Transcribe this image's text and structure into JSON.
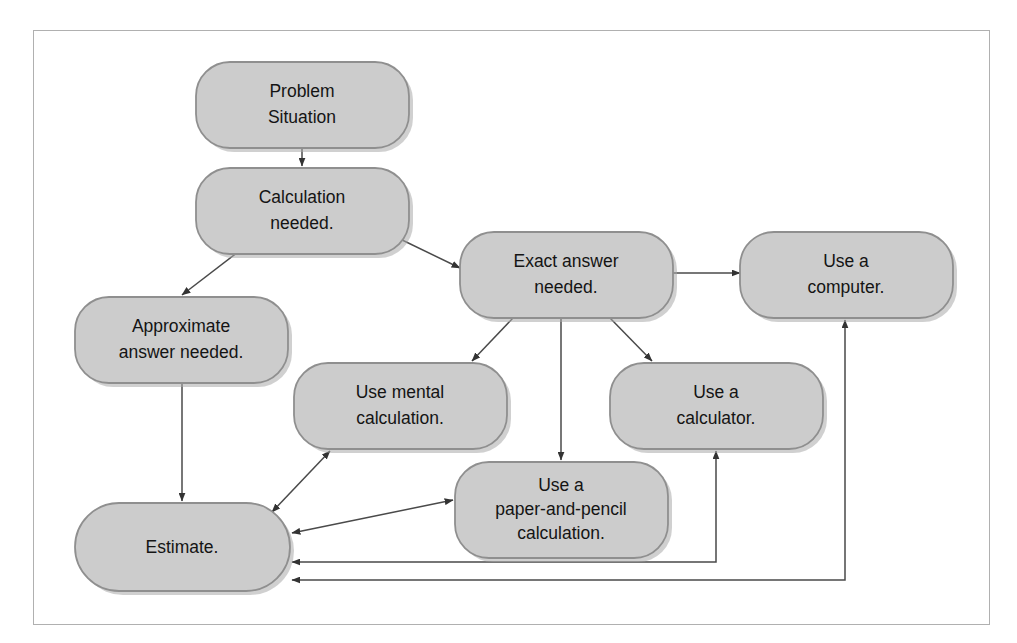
{
  "diagram": {
    "frame": {
      "border_color": "#b0b0b0"
    },
    "style": {
      "node_fill": "#cccccc",
      "node_stroke": "#8f8f8f",
      "edge_color": "#4a4a4a",
      "text_color": "#141414",
      "background": "#ffffff"
    },
    "nodes": [
      {
        "id": "problem-situation",
        "lines": [
          "Problem",
          "Situation"
        ],
        "x": 196,
        "y": 62,
        "w": 213,
        "h": 86
      },
      {
        "id": "calculation-needed",
        "lines": [
          "Calculation",
          "needed."
        ],
        "x": 196,
        "y": 168,
        "w": 213,
        "h": 86
      },
      {
        "id": "exact-answer-needed",
        "lines": [
          "Exact answer",
          "needed."
        ],
        "x": 460,
        "y": 232,
        "w": 213,
        "h": 86
      },
      {
        "id": "use-a-computer",
        "lines": [
          "Use a",
          "computer."
        ],
        "x": 740,
        "y": 232,
        "w": 213,
        "h": 86
      },
      {
        "id": "approximate-answer-needed",
        "lines": [
          "Approximate",
          "answer needed."
        ],
        "x": 75,
        "y": 297,
        "w": 213,
        "h": 86
      },
      {
        "id": "use-mental-calculation",
        "lines": [
          "Use mental",
          "calculation."
        ],
        "x": 294,
        "y": 363,
        "w": 213,
        "h": 86
      },
      {
        "id": "use-a-calculator",
        "lines": [
          "Use a",
          "calculator."
        ],
        "x": 610,
        "y": 363,
        "w": 213,
        "h": 86
      },
      {
        "id": "use-paper-and-pencil",
        "lines": [
          "Use a",
          "paper-and-pencil",
          "calculation."
        ],
        "x": 455,
        "y": 462,
        "w": 213,
        "h": 96
      },
      {
        "id": "estimate",
        "lines": [
          "Estimate."
        ],
        "x": 75,
        "y": 503,
        "w": 215,
        "h": 88
      }
    ],
    "edges": [
      {
        "id": "problem-to-calculation",
        "from": "problem-situation",
        "to": "calculation-needed",
        "arrows": "one-way"
      },
      {
        "id": "calculation-to-approximate",
        "from": "calculation-needed",
        "to": "approximate-answer-needed",
        "arrows": "one-way"
      },
      {
        "id": "calculation-to-exact",
        "from": "calculation-needed",
        "to": "exact-answer-needed",
        "arrows": "one-way"
      },
      {
        "id": "exact-to-computer",
        "from": "exact-answer-needed",
        "to": "use-a-computer",
        "arrows": "one-way"
      },
      {
        "id": "exact-to-mental",
        "from": "exact-answer-needed",
        "to": "use-mental-calculation",
        "arrows": "one-way"
      },
      {
        "id": "exact-to-paper-pencil",
        "from": "exact-answer-needed",
        "to": "use-paper-and-pencil",
        "arrows": "one-way"
      },
      {
        "id": "exact-to-calculator",
        "from": "exact-answer-needed",
        "to": "use-a-calculator",
        "arrows": "one-way"
      },
      {
        "id": "approximate-to-estimate",
        "from": "approximate-answer-needed",
        "to": "estimate",
        "arrows": "one-way"
      },
      {
        "id": "estimate-to-mental",
        "from": "estimate",
        "to": "use-mental-calculation",
        "arrows": "two-way"
      },
      {
        "id": "estimate-to-paper-pencil",
        "from": "estimate",
        "to": "use-paper-and-pencil",
        "arrows": "two-way"
      },
      {
        "id": "estimate-to-calculator",
        "from": "estimate",
        "to": "use-a-calculator",
        "arrows": "two-way"
      },
      {
        "id": "estimate-to-computer",
        "from": "estimate",
        "to": "use-a-computer",
        "arrows": "two-way"
      }
    ]
  }
}
